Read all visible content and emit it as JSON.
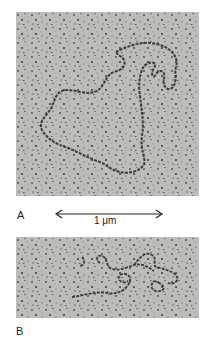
{
  "figure": {
    "panels": [
      {
        "id": "A",
        "label": "A",
        "description": "Electron micrograph of a single long circular DNA molecule, relaxed loop"
      },
      {
        "id": "B",
        "label": "B",
        "description": "Electron micrograph of a supercoiled / tangled DNA molecule"
      }
    ],
    "scale_bar": {
      "label": "1 μm",
      "icon": "double-arrow-icon"
    },
    "colors": {
      "background": "#b9b9b6",
      "dna_strand": "#3a3a3a",
      "speckle": "#4a4a4a"
    }
  }
}
